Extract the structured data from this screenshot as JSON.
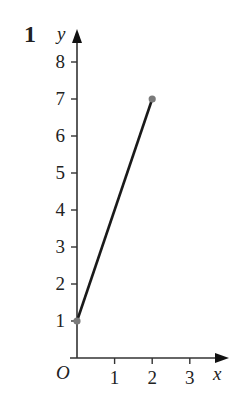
{
  "question_number": "1",
  "chart_data": {
    "type": "line",
    "title": "",
    "xlabel": "x",
    "ylabel": "y",
    "origin_label": "O",
    "x_ticks": [
      1,
      2,
      3
    ],
    "y_ticks": [
      1,
      2,
      3,
      4,
      5,
      6,
      7,
      8
    ],
    "xlim": [
      0,
      3.5
    ],
    "ylim": [
      0,
      8.7
    ],
    "grid": false,
    "legend": null,
    "series": [
      {
        "name": "segment",
        "x": [
          0,
          2
        ],
        "y": [
          1,
          7
        ],
        "line_color": "#1a1a1a",
        "endpoint_color": "#7a7a7a"
      }
    ]
  },
  "colors": {
    "axis": "#333333",
    "line": "#1a1a1a",
    "endpoint": "#7a7a7a"
  }
}
